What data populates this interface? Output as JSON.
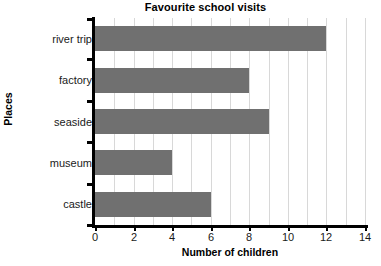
{
  "chart_data": {
    "type": "bar",
    "orientation": "horizontal",
    "title": "Favourite school visits",
    "xlabel": "Number of children",
    "ylabel": "Places",
    "categories": [
      "river trip",
      "factory",
      "seaside",
      "museum",
      "castle"
    ],
    "values": [
      12,
      8,
      9,
      4,
      6
    ],
    "xlim": [
      0,
      14
    ],
    "xticks": [
      0,
      2,
      4,
      6,
      8,
      10,
      12,
      14
    ],
    "xtick_labels": [
      "0",
      "2",
      "4",
      "6",
      "8",
      "10",
      "12",
      "14"
    ],
    "gridlines": [
      1,
      2,
      3,
      4,
      5,
      6,
      7,
      8,
      9,
      10,
      11,
      12,
      13,
      14
    ],
    "grid": true,
    "grid_axis": "x",
    "legend": null,
    "bar_color": "#707070",
    "grid_color": "#d8d8d8",
    "axis_color": "#000000",
    "background_color": "#ffffff"
  }
}
